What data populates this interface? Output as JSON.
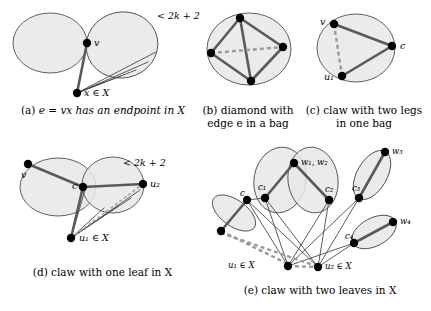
{
  "figure": {
    "background_color": "#ffffff",
    "bag_fill_color": "#e8e8e8",
    "bag_stroke_color": "#3a3a3a",
    "thick_edge_color": "#5a5a5a",
    "thin_edge_color": "#4a4a4a",
    "dashed_edge_color": "#9a9a9a",
    "node_color": "#000000"
  },
  "panels": [
    {
      "id": "a",
      "caption": "(a) e = vx has an endpoint in X",
      "caption_parts": {
        "tag": "(a)",
        "math_e": "e",
        "eq": "=",
        "math_vx": "vx",
        "rest": "has an endpoint in",
        "set": "X"
      },
      "annotation": "< 2k + 2",
      "vertex_labels": [
        {
          "name": "v",
          "text": "v"
        },
        {
          "name": "x-in-X",
          "text": "x ∈ X"
        }
      ]
    },
    {
      "id": "b",
      "caption": "(b) diamond with edge e in a bag",
      "caption_lines": [
        "(b) diamond with",
        "edge e in a bag"
      ],
      "vertex_labels": []
    },
    {
      "id": "c",
      "caption": "(c) claw with two legs in one bag",
      "caption_lines": [
        "(c) claw with two legs",
        "in one bag"
      ],
      "vertex_labels": [
        {
          "name": "v",
          "text": "v"
        },
        {
          "name": "c",
          "text": "c"
        },
        {
          "name": "u1",
          "text": "u₁"
        }
      ]
    },
    {
      "id": "d",
      "caption": "(d) claw with one leaf in X",
      "annotation": "< 2k + 2",
      "vertex_labels": [
        {
          "name": "v",
          "text": "v"
        },
        {
          "name": "c",
          "text": "c"
        },
        {
          "name": "u2",
          "text": "u₂"
        },
        {
          "name": "u1-in-X",
          "text": "u₁ ∈ X"
        }
      ]
    },
    {
      "id": "e",
      "caption": "(e) claw with two leaves in X",
      "vertex_labels": [
        {
          "name": "c",
          "text": "c"
        },
        {
          "name": "c1",
          "text": "c₁"
        },
        {
          "name": "c2",
          "text": "c₂"
        },
        {
          "name": "c3",
          "text": "c₃"
        },
        {
          "name": "c4",
          "text": "c₄"
        },
        {
          "name": "w1w2",
          "text": "w₁, w₂"
        },
        {
          "name": "w3",
          "text": "w₃"
        },
        {
          "name": "w4",
          "text": "w₄"
        },
        {
          "name": "u1-in-X",
          "text": "u₁ ∈ X"
        },
        {
          "name": "u2-in-X",
          "text": "u₂ ∈ X"
        }
      ]
    }
  ],
  "labels": {
    "panel_a": {
      "annotation": "< 2k + 2",
      "v": "v",
      "x": "x ∈ X",
      "caption_tag": "(a)",
      "caption_body": "e = vx has an endpoint in X"
    },
    "panel_b": {
      "caption_line1": "(b) diamond with",
      "caption_line2": "edge e in a bag"
    },
    "panel_c": {
      "v": "v",
      "c": "c",
      "u1": "u₁",
      "caption_line1": "(c) claw with two legs",
      "caption_line2": "in one bag"
    },
    "panel_d": {
      "annotation": "< 2k + 2",
      "v": "v",
      "c": "c",
      "u2": "u₂",
      "u1": "u₁ ∈ X",
      "caption": "(d) claw with one leaf in X"
    },
    "panel_e": {
      "c": "c",
      "c1": "c₁",
      "c2": "c₂",
      "c3": "c₃",
      "c4": "c₄",
      "w12": "w₁, w₂",
      "w3": "w₃",
      "w4": "w₄",
      "u1": "u₁ ∈ X",
      "u2": "u₂ ∈ X",
      "caption": "(e) claw with two leaves in X"
    }
  }
}
